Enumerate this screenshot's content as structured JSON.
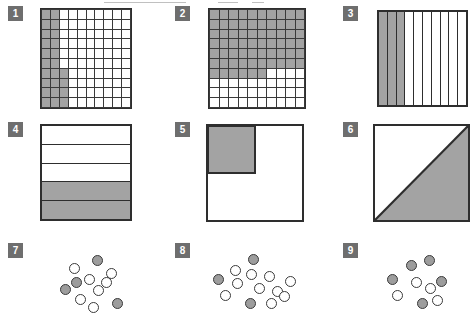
{
  "sheet": {
    "title": "Proportion estimation worksheet",
    "background_color": "#ffffff",
    "shade_color": "#a3a3a3",
    "line_color": "#2e2e2e",
    "badge_color": "#6e6e6e"
  },
  "panels": [
    {
      "number": "1",
      "type": "grid",
      "rows": 10,
      "cols": 10,
      "shaded_count": 23,
      "total_count": 100,
      "shaded_cells_per_row": [
        2,
        2,
        2,
        2,
        2,
        2,
        3,
        3,
        3,
        3
      ],
      "x": 40,
      "y": 8,
      "w": 88,
      "h": 97
    },
    {
      "number": "2",
      "type": "grid",
      "rows": 10,
      "cols": 10,
      "shaded_count": 66,
      "total_count": 100,
      "shaded_cells_per_row": [
        10,
        10,
        10,
        10,
        10,
        10,
        6,
        0,
        0,
        0
      ],
      "x": 208,
      "y": 8,
      "w": 94,
      "h": 97
    },
    {
      "number": "3",
      "type": "strips",
      "strips": 10,
      "shaded_count": 3,
      "x": 377,
      "y": 10,
      "w": 89,
      "h": 93
    },
    {
      "number": "4",
      "type": "bands",
      "bands": 5,
      "shaded_count": 2,
      "shaded_bands": [
        false,
        false,
        false,
        true,
        true
      ],
      "x": 40,
      "y": 124,
      "w": 88,
      "h": 93
    },
    {
      "number": "5",
      "type": "square-quadrant",
      "shaded_fraction": "1/4",
      "quad_w_frac": 0.5,
      "quad_h_frac": 0.5,
      "x": 206,
      "y": 124,
      "w": 94,
      "h": 94
    },
    {
      "number": "6",
      "type": "square-diagonal",
      "shaded_fraction": "1/2",
      "shaded_side": "lower-right",
      "x": 373,
      "y": 124,
      "w": 93,
      "h": 94
    },
    {
      "number": "7",
      "type": "dots",
      "total_dots": 11,
      "shaded_dots": 4,
      "dots": [
        {
          "x": 14,
          "y": 13,
          "shaded": false
        },
        {
          "x": 37,
          "y": 5,
          "shaded": true
        },
        {
          "x": 51,
          "y": 18,
          "shaded": false
        },
        {
          "x": 29,
          "y": 24,
          "shaded": false
        },
        {
          "x": 16,
          "y": 27,
          "shaded": true
        },
        {
          "x": 5,
          "y": 34,
          "shaded": true
        },
        {
          "x": 38,
          "y": 35,
          "shaded": false
        },
        {
          "x": 20,
          "y": 44,
          "shaded": false
        },
        {
          "x": 33,
          "y": 52,
          "shaded": false
        },
        {
          "x": 57,
          "y": 48,
          "shaded": true
        },
        {
          "x": 46,
          "y": 27,
          "shaded": false
        }
      ],
      "x": 55,
      "y": 250,
      "w": 80,
      "h": 66
    },
    {
      "number": "8",
      "type": "dots",
      "total_dots": 13,
      "shaded_dots": 3,
      "dots": [
        {
          "x": 38,
          "y": 4,
          "shaded": true
        },
        {
          "x": 20,
          "y": 15,
          "shaded": false
        },
        {
          "x": 36,
          "y": 19,
          "shaded": false
        },
        {
          "x": 54,
          "y": 21,
          "shaded": false
        },
        {
          "x": 3,
          "y": 24,
          "shaded": true
        },
        {
          "x": 22,
          "y": 28,
          "shaded": false
        },
        {
          "x": 75,
          "y": 26,
          "shaded": false
        },
        {
          "x": 44,
          "y": 33,
          "shaded": false
        },
        {
          "x": 62,
          "y": 36,
          "shaded": false
        },
        {
          "x": 10,
          "y": 40,
          "shaded": false
        },
        {
          "x": 35,
          "y": 48,
          "shaded": true
        },
        {
          "x": 56,
          "y": 48,
          "shaded": false
        },
        {
          "x": 69,
          "y": 41,
          "shaded": false
        }
      ],
      "x": 210,
      "y": 250,
      "w": 90,
      "h": 66
    },
    {
      "number": "9",
      "type": "dots",
      "total_dots": 9,
      "shaded_dots": 5,
      "dots": [
        {
          "x": 28,
          "y": 7,
          "shaded": true
        },
        {
          "x": 46,
          "y": 2,
          "shaded": true
        },
        {
          "x": 9,
          "y": 21,
          "shaded": true
        },
        {
          "x": 33,
          "y": 24,
          "shaded": false
        },
        {
          "x": 58,
          "y": 23,
          "shaded": true
        },
        {
          "x": 14,
          "y": 37,
          "shaded": false
        },
        {
          "x": 39,
          "y": 45,
          "shaded": true
        },
        {
          "x": 54,
          "y": 42,
          "shaded": false
        },
        {
          "x": 47,
          "y": 30,
          "shaded": false
        }
      ],
      "x": 378,
      "y": 253,
      "w": 80,
      "h": 62
    }
  ]
}
